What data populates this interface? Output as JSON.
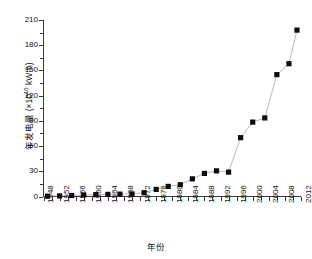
{
  "chart_data": {
    "type": "line",
    "title": "",
    "subtitle": "",
    "xlabel": "年份",
    "ylabel": "年发电量 (×10¹⁰ kW·h)",
    "ylabel_parts": {
      "prefix": "年发电量 (×10",
      "exponent": "10",
      "suffix": " kW·h)"
    },
    "xlim": [
      1948,
      2012
    ],
    "ylim": [
      0,
      210
    ],
    "yticks": [
      0,
      30,
      60,
      90,
      120,
      150,
      180,
      210
    ],
    "ytick_labels": [
      "0",
      "30",
      "60",
      "90",
      "120",
      "150",
      "180",
      "210"
    ],
    "xticks": [
      1948,
      1952,
      1956,
      1960,
      1964,
      1968,
      1972,
      1976,
      1980,
      1984,
      1988,
      1992,
      1996,
      2000,
      2004,
      2008,
      2012
    ],
    "xtick_labels": [
      "1948",
      "1952",
      "1956",
      "1960",
      "1964",
      "1968",
      "1972",
      "1976",
      "1980",
      "1984",
      "1988",
      "1992",
      "1996",
      "2000",
      "2004",
      "2008",
      "2012"
    ],
    "grid": false,
    "legend": false,
    "marker": "square",
    "marker_color": "#0d0d0d",
    "line_color": "#9a9a9a",
    "series": [
      {
        "name": "年发电量",
        "x": [
          1949,
          1952,
          1955,
          1958,
          1961,
          1964,
          1967,
          1970,
          1973,
          1976,
          1979,
          1982,
          1985,
          1988,
          1991,
          1994,
          1997,
          2000,
          2003,
          2006,
          2009,
          2011
        ],
        "values": [
          0.4,
          0.7,
          1.2,
          1.8,
          2.2,
          2.5,
          2.8,
          3.0,
          4.5,
          8.5,
          12.0,
          14.0,
          21.0,
          27.5,
          30.5,
          29.0,
          70.0,
          88.5,
          93.5,
          145.0,
          158.0,
          198.0
        ]
      }
    ]
  }
}
